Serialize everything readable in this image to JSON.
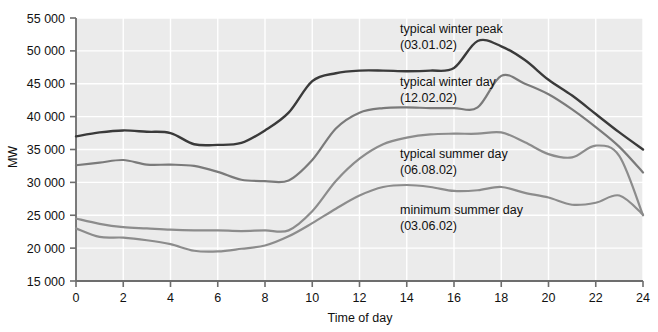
{
  "chart_data": {
    "type": "line",
    "title": "",
    "xlabel": "Time of day",
    "ylabel": "MW",
    "xlim": [
      0,
      24
    ],
    "ylim": [
      15000,
      55000
    ],
    "xticks": [
      0,
      2,
      4,
      6,
      8,
      10,
      12,
      14,
      16,
      18,
      20,
      22,
      24
    ],
    "xtick_labels": [
      "0",
      "2",
      "4",
      "6",
      "8",
      "10",
      "12",
      "14",
      "16",
      "18",
      "20",
      "22",
      "24"
    ],
    "yticks": [
      15000,
      20000,
      25000,
      30000,
      35000,
      40000,
      45000,
      50000,
      55000
    ],
    "ytick_labels": [
      "15 000",
      "20 000",
      "25 000",
      "30 000",
      "35 000",
      "40 000",
      "45 000",
      "50 000",
      "55 000"
    ],
    "grid": true,
    "grid_color": "#ffffff",
    "plot_background": "#ebebeb",
    "legend": "annotations-on-plot",
    "x": [
      0,
      1,
      2,
      3,
      4,
      5,
      6,
      7,
      8,
      9,
      10,
      11,
      12,
      13,
      14,
      15,
      16,
      17,
      18,
      19,
      20,
      21,
      22,
      23,
      24
    ],
    "series": [
      {
        "name": "typical winter peak",
        "date": "03.01.02",
        "label_line1": "typical winter peak",
        "label_line2": "(03.01.02)",
        "color": "#3a3a3a",
        "linewidth": 2.4,
        "values": [
          37000,
          37600,
          37900,
          37700,
          37500,
          37900,
          37100,
          36100,
          35800,
          35700,
          36000,
          37900,
          40600,
          43300,
          45400,
          46600,
          47000,
          47000,
          46900,
          47000,
          47400,
          48500,
          50400,
          51500,
          51300
        ],
        "values_hours": {
          "0": 37000,
          "1": 37600,
          "2": 37900,
          "3": 37700,
          "4": 37500,
          "5": 35800,
          "6": 35700,
          "7": 36000,
          "8": 37900,
          "9": 40600,
          "10": 45400,
          "11": 46600,
          "12": 47000,
          "13": 47000,
          "14": 46900,
          "15": 47000,
          "16": 47400,
          "17": 51500,
          "18": 50700,
          "19": 48600,
          "20": 45600,
          "21": 43200,
          "22": 40400,
          "23": 37600,
          "24": 35000
        }
      },
      {
        "name": "typical winter day",
        "date": "12.02.02",
        "label_line1": "typical winter day",
        "label_line2": "(12.02.02)",
        "color": "#7a7a7a",
        "linewidth": 2.2,
        "values_hours": {
          "0": 32600,
          "1": 33000,
          "2": 33400,
          "3": 32700,
          "4": 32700,
          "5": 32500,
          "6": 31600,
          "7": 30400,
          "8": 30200,
          "9": 30300,
          "10": 33400,
          "11": 38200,
          "12": 40600,
          "13": 41300,
          "14": 41400,
          "15": 41300,
          "16": 41300,
          "17": 41400,
          "18": 46200,
          "19": 45000,
          "20": 43400,
          "21": 41100,
          "22": 38400,
          "23": 35400,
          "24": 31500
        }
      },
      {
        "name": "typical summer day",
        "date": "06.08.02",
        "label_line1": "typical summer day",
        "label_line2": "(06.08.02)",
        "color": "#8c8c8c",
        "linewidth": 2.2,
        "values_hours": {
          "0": 24500,
          "1": 23700,
          "2": 23200,
          "3": 23000,
          "4": 22800,
          "5": 22700,
          "6": 22700,
          "7": 22600,
          "8": 22700,
          "9": 22700,
          "10": 25600,
          "11": 30200,
          "12": 33600,
          "13": 35800,
          "14": 36800,
          "15": 37300,
          "16": 37400,
          "17": 37400,
          "18": 37600,
          "19": 36100,
          "20": 34300,
          "21": 33800,
          "22": 35600,
          "23": 34000,
          "24": 25000
        }
      },
      {
        "name": "minimum summer day",
        "date": "03.06.02",
        "label_line1": "minimum summer day",
        "label_line2": "(03.06.02)",
        "color": "#8c8c8c",
        "linewidth": 2.2,
        "values_hours": {
          "0": 23000,
          "1": 21700,
          "2": 21600,
          "3": 21200,
          "4": 20600,
          "5": 19600,
          "6": 19500,
          "7": 19900,
          "8": 20400,
          "9": 21800,
          "10": 23800,
          "11": 26000,
          "12": 28000,
          "13": 29300,
          "14": 29600,
          "15": 29300,
          "16": 28700,
          "17": 28800,
          "18": 29300,
          "19": 28400,
          "20": 27700,
          "21": 26600,
          "22": 26900,
          "23": 28000,
          "24": 25100
        }
      }
    ],
    "annotations": [
      {
        "name": "typical-winter-peak-annotation",
        "line1": "typical winter peak",
        "line2": "(03.01.02)"
      },
      {
        "name": "typical-winter-day-annotation",
        "line1": "typical winter day",
        "line2": "(12.02.02)"
      },
      {
        "name": "typical-summer-day-annotation",
        "line1": "typical summer day",
        "line2": "(06.08.02)"
      },
      {
        "name": "minimum-summer-day-annotation",
        "line1": "minimum summer day",
        "line2": "(03.06.02)"
      }
    ]
  }
}
